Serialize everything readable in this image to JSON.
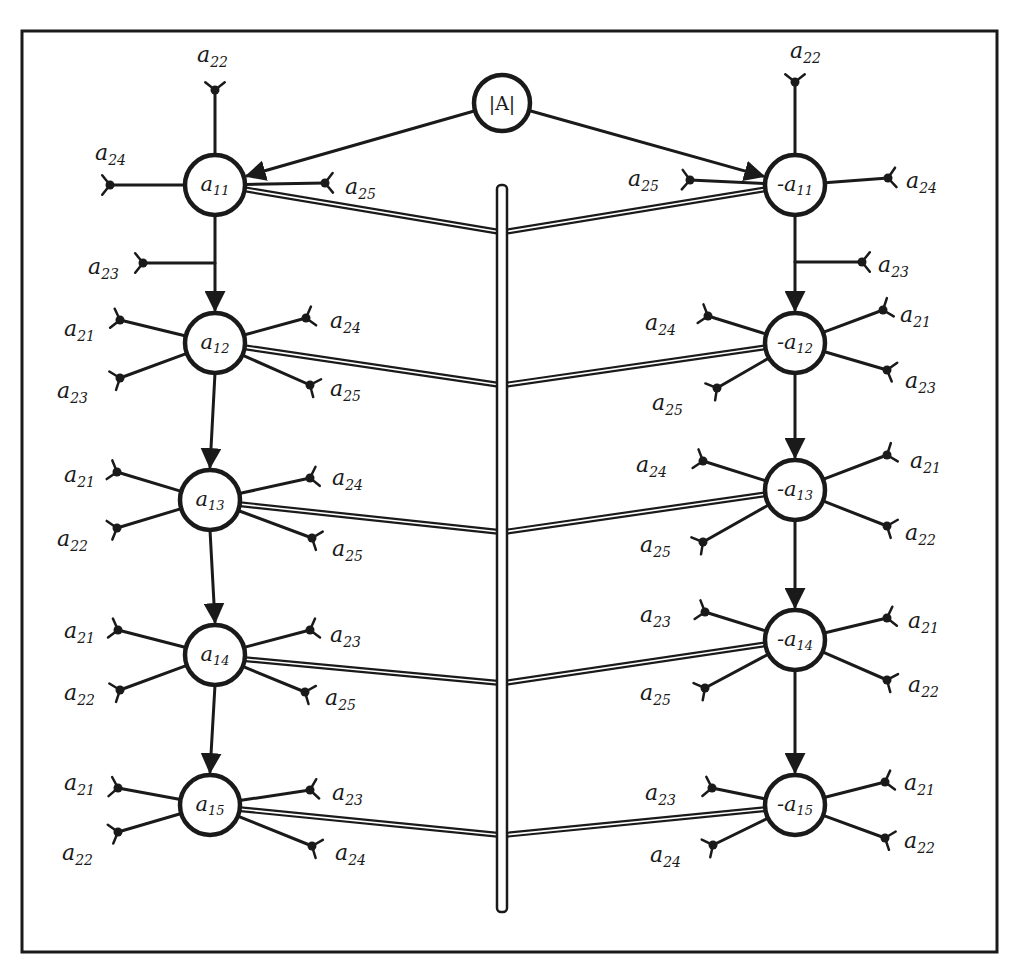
{
  "frame": {
    "x": 22,
    "y": 31,
    "w": 975,
    "h": 921
  },
  "root": {
    "id": "detA",
    "label": "|A|",
    "x": 502,
    "y": 103,
    "r": 28
  },
  "central_bar": {
    "x": 502,
    "y1": 185,
    "y2": 912,
    "width": 10
  },
  "diagram": {
    "title": ""
  },
  "left_column": [
    {
      "id": "a11",
      "base": "a",
      "sub": "11",
      "sign": "",
      "x": 215,
      "y": 185,
      "r": 30,
      "leaves": [
        {
          "base": "a",
          "sub": "22",
          "lx": 197,
          "ly": 62,
          "ex": 215,
          "ey": 90,
          "dir": "up"
        },
        {
          "base": "a",
          "sub": "24",
          "lx": 95,
          "ly": 160,
          "ex": 110,
          "ey": 185,
          "dir": "left"
        },
        {
          "base": "a",
          "sub": "25",
          "lx": 345,
          "ly": 194,
          "ex": 325,
          "ey": 183,
          "dir": "right"
        },
        {
          "base": "a",
          "sub": "23",
          "lx": 88,
          "ly": 274,
          "ex": 143,
          "ey": 263,
          "dir": "left",
          "from_stem": true,
          "stem_y": 263
        }
      ]
    },
    {
      "id": "a12",
      "base": "a",
      "sub": "12",
      "sign": "",
      "x": 215,
      "y": 343,
      "r": 30,
      "leaves": [
        {
          "base": "a",
          "sub": "21",
          "lx": 64,
          "ly": 336,
          "ex": 120,
          "ey": 320,
          "dir": "left"
        },
        {
          "base": "a",
          "sub": "23",
          "lx": 57,
          "ly": 398,
          "ex": 120,
          "ey": 378,
          "dir": "left"
        },
        {
          "base": "a",
          "sub": "24",
          "lx": 330,
          "ly": 328,
          "ex": 306,
          "ey": 318,
          "dir": "right"
        },
        {
          "base": "a",
          "sub": "25",
          "lx": 330,
          "ly": 396,
          "ex": 310,
          "ey": 385,
          "dir": "right"
        }
      ]
    },
    {
      "id": "a13",
      "base": "a",
      "sub": "13",
      "sign": "",
      "x": 210,
      "y": 500,
      "r": 30,
      "leaves": [
        {
          "base": "a",
          "sub": "21",
          "lx": 64,
          "ly": 482,
          "ex": 117,
          "ey": 472,
          "dir": "left"
        },
        {
          "base": "a",
          "sub": "22",
          "lx": 57,
          "ly": 546,
          "ex": 117,
          "ey": 528,
          "dir": "left"
        },
        {
          "base": "a",
          "sub": "24",
          "lx": 332,
          "ly": 485,
          "ex": 310,
          "ey": 478,
          "dir": "right"
        },
        {
          "base": "a",
          "sub": "25",
          "lx": 332,
          "ly": 556,
          "ex": 312,
          "ey": 538,
          "dir": "right"
        }
      ]
    },
    {
      "id": "a14",
      "base": "a",
      "sub": "14",
      "sign": "",
      "x": 215,
      "y": 655,
      "r": 30,
      "leaves": [
        {
          "base": "a",
          "sub": "21",
          "lx": 64,
          "ly": 638,
          "ex": 118,
          "ey": 630,
          "dir": "left"
        },
        {
          "base": "a",
          "sub": "22",
          "lx": 64,
          "ly": 700,
          "ex": 120,
          "ey": 690,
          "dir": "left"
        },
        {
          "base": "a",
          "sub": "23",
          "lx": 330,
          "ly": 642,
          "ex": 310,
          "ey": 630,
          "dir": "right"
        },
        {
          "base": "a",
          "sub": "25",
          "lx": 325,
          "ly": 705,
          "ex": 305,
          "ey": 692,
          "dir": "right"
        }
      ]
    },
    {
      "id": "a15",
      "base": "a",
      "sub": "15",
      "sign": "",
      "x": 210,
      "y": 805,
      "r": 30,
      "leaves": [
        {
          "base": "a",
          "sub": "21",
          "lx": 64,
          "ly": 790,
          "ex": 118,
          "ey": 788,
          "dir": "left"
        },
        {
          "base": "a",
          "sub": "22",
          "lx": 62,
          "ly": 860,
          "ex": 118,
          "ey": 832,
          "dir": "left"
        },
        {
          "base": "a",
          "sub": "23",
          "lx": 332,
          "ly": 800,
          "ex": 310,
          "ey": 790,
          "dir": "right"
        },
        {
          "base": "a",
          "sub": "24",
          "lx": 335,
          "ly": 860,
          "ex": 312,
          "ey": 846,
          "dir": "right"
        }
      ]
    }
  ],
  "right_column": [
    {
      "id": "-a11",
      "base": "a",
      "sub": "11",
      "sign": "-",
      "x": 795,
      "y": 185,
      "r": 30,
      "leaves": [
        {
          "base": "a",
          "sub": "22",
          "lx": 790,
          "ly": 58,
          "ex": 795,
          "ey": 82,
          "dir": "up"
        },
        {
          "base": "a",
          "sub": "25",
          "lx": 628,
          "ly": 186,
          "ex": 690,
          "ey": 180,
          "dir": "left"
        },
        {
          "base": "a",
          "sub": "24",
          "lx": 906,
          "ly": 188,
          "ex": 888,
          "ey": 178,
          "dir": "right"
        },
        {
          "base": "a",
          "sub": "23",
          "lx": 878,
          "ly": 272,
          "ex": 862,
          "ey": 262,
          "dir": "right",
          "from_stem": true,
          "stem_y": 262
        }
      ]
    },
    {
      "id": "-a12",
      "base": "a",
      "sub": "12",
      "sign": "-",
      "x": 795,
      "y": 343,
      "r": 30,
      "leaves": [
        {
          "base": "a",
          "sub": "24",
          "lx": 645,
          "ly": 330,
          "ex": 708,
          "ey": 316,
          "dir": "left"
        },
        {
          "base": "a",
          "sub": "25",
          "lx": 652,
          "ly": 410,
          "ex": 717,
          "ey": 388,
          "dir": "left"
        },
        {
          "base": "a",
          "sub": "21",
          "lx": 900,
          "ly": 322,
          "ex": 883,
          "ey": 310,
          "dir": "right"
        },
        {
          "base": "a",
          "sub": "23",
          "lx": 905,
          "ly": 388,
          "ex": 887,
          "ey": 370,
          "dir": "right"
        }
      ]
    },
    {
      "id": "-a13",
      "base": "a",
      "sub": "13",
      "sign": "-",
      "x": 795,
      "y": 490,
      "r": 30,
      "leaves": [
        {
          "base": "a",
          "sub": "24",
          "lx": 636,
          "ly": 472,
          "ex": 703,
          "ey": 461,
          "dir": "left"
        },
        {
          "base": "a",
          "sub": "25",
          "lx": 640,
          "ly": 552,
          "ex": 703,
          "ey": 542,
          "dir": "left"
        },
        {
          "base": "a",
          "sub": "21",
          "lx": 910,
          "ly": 468,
          "ex": 887,
          "ey": 455,
          "dir": "right"
        },
        {
          "base": "a",
          "sub": "22",
          "lx": 905,
          "ly": 540,
          "ex": 887,
          "ey": 526,
          "dir": "right"
        }
      ]
    },
    {
      "id": "-a14",
      "base": "a",
      "sub": "14",
      "sign": "-",
      "x": 795,
      "y": 640,
      "r": 30,
      "leaves": [
        {
          "base": "a",
          "sub": "23",
          "lx": 640,
          "ly": 622,
          "ex": 705,
          "ey": 612,
          "dir": "left"
        },
        {
          "base": "a",
          "sub": "25",
          "lx": 640,
          "ly": 700,
          "ex": 705,
          "ey": 688,
          "dir": "left"
        },
        {
          "base": "a",
          "sub": "21",
          "lx": 908,
          "ly": 628,
          "ex": 887,
          "ey": 618,
          "dir": "right"
        },
        {
          "base": "a",
          "sub": "22",
          "lx": 908,
          "ly": 692,
          "ex": 887,
          "ey": 680,
          "dir": "right"
        }
      ]
    },
    {
      "id": "-a15",
      "base": "a",
      "sub": "15",
      "sign": "-",
      "x": 795,
      "y": 805,
      "r": 30,
      "leaves": [
        {
          "base": "a",
          "sub": "23",
          "lx": 645,
          "ly": 800,
          "ex": 712,
          "ey": 788,
          "dir": "left"
        },
        {
          "base": "a",
          "sub": "24",
          "lx": 650,
          "ly": 862,
          "ex": 713,
          "ey": 845,
          "dir": "left"
        },
        {
          "base": "a",
          "sub": "21",
          "lx": 904,
          "ly": 790,
          "ex": 885,
          "ey": 782,
          "dir": "right"
        },
        {
          "base": "a",
          "sub": "22",
          "lx": 904,
          "ly": 848,
          "ex": 885,
          "ey": 838,
          "dir": "right"
        }
      ]
    }
  ],
  "bar_joins": [
    {
      "from": "a11",
      "bar_y": 232
    },
    {
      "from": "-a11",
      "bar_y": 232
    },
    {
      "from": "a12",
      "bar_y": 385
    },
    {
      "from": "-a12",
      "bar_y": 385
    },
    {
      "from": "a13",
      "bar_y": 532
    },
    {
      "from": "-a13",
      "bar_y": 532
    },
    {
      "from": "a14",
      "bar_y": 683
    },
    {
      "from": "-a14",
      "bar_y": 683
    },
    {
      "from": "a15",
      "bar_y": 835
    },
    {
      "from": "-a15",
      "bar_y": 835
    }
  ]
}
